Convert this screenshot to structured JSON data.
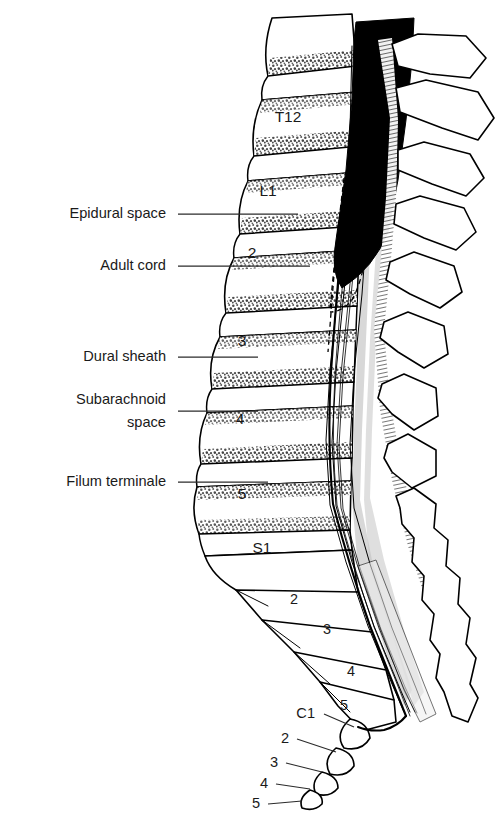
{
  "figure": {
    "background_color": "#ffffff",
    "ink_color": "#000000",
    "shading_color": "#d8d8d8"
  },
  "labels": [
    {
      "id": "epidural-space",
      "text": "Epidural space",
      "text_x": 166,
      "text_y": 218,
      "leader_x1": 178,
      "leader_y1": 214,
      "leader_x2": 298,
      "leader_y2": 214
    },
    {
      "id": "adult-cord",
      "text": "Adult cord",
      "text_x": 166,
      "text_y": 270,
      "leader_x1": 178,
      "leader_y1": 266,
      "leader_x2": 310,
      "leader_y2": 266
    },
    {
      "id": "dural-sheath",
      "text": "Dural sheath",
      "text_x": 166,
      "text_y": 361,
      "leader_x1": 178,
      "leader_y1": 357,
      "leader_x2": 258,
      "leader_y2": 357
    },
    {
      "id": "subarachnoid-space",
      "text": "Subarachnoid",
      "text_x": 166,
      "text_y": 404,
      "text_line2": "space",
      "text_line2_x": 166,
      "text_line2_y": 427,
      "leader_x1": 178,
      "leader_y1": 411,
      "leader_x2": 258,
      "leader_y2": 411
    },
    {
      "id": "filum-terminale",
      "text": "Filum terminale",
      "text_x": 166,
      "text_y": 486,
      "leader_x1": 178,
      "leader_y1": 482,
      "leader_x2": 268,
      "leader_y2": 482
    }
  ],
  "vertebrae": [
    {
      "id": "T12",
      "label": "T12",
      "x": 288,
      "y": 122,
      "region": "thoracic"
    },
    {
      "id": "L1",
      "label": "L1",
      "x": 268,
      "y": 196,
      "region": "lumbar"
    },
    {
      "id": "L2",
      "label": "2",
      "x": 252,
      "y": 258,
      "region": "lumbar"
    },
    {
      "id": "L3",
      "label": "3",
      "x": 242,
      "y": 346,
      "region": "lumbar"
    },
    {
      "id": "L4",
      "label": "4",
      "x": 240,
      "y": 424,
      "region": "lumbar"
    },
    {
      "id": "L5",
      "label": "5",
      "x": 242,
      "y": 499,
      "region": "lumbar"
    },
    {
      "id": "S1",
      "label": "S1",
      "x": 262,
      "y": 553,
      "region": "sacral"
    },
    {
      "id": "S2",
      "label": "2",
      "x": 294,
      "y": 604,
      "region": "sacral"
    },
    {
      "id": "S3",
      "label": "3",
      "x": 327,
      "y": 634,
      "region": "sacral"
    },
    {
      "id": "S4",
      "label": "4",
      "x": 351,
      "y": 676,
      "region": "sacral"
    },
    {
      "id": "S5",
      "label": "5",
      "x": 344,
      "y": 710,
      "region": "sacral"
    }
  ],
  "coccyx": [
    {
      "id": "C1",
      "label": "C1",
      "text_x": 315,
      "text_y": 718,
      "leader_x1": 324,
      "leader_y1": 714,
      "leader_x2": 354,
      "leader_y2": 727
    },
    {
      "id": "C2",
      "label": "2",
      "text_x": 289,
      "text_y": 743,
      "leader_x1": 297,
      "leader_y1": 739,
      "leader_x2": 336,
      "leader_y2": 752
    },
    {
      "id": "C3",
      "label": "3",
      "text_x": 278,
      "text_y": 767,
      "leader_x1": 286,
      "leader_y1": 763,
      "leader_x2": 322,
      "leader_y2": 772
    },
    {
      "id": "C4",
      "label": "4",
      "text_x": 268,
      "text_y": 788,
      "leader_x1": 276,
      "leader_y1": 784,
      "leader_x2": 310,
      "leader_y2": 789
    },
    {
      "id": "C5",
      "label": "5",
      "text_x": 260,
      "text_y": 808,
      "leader_x1": 268,
      "leader_y1": 804,
      "leader_x2": 302,
      "leader_y2": 801
    }
  ]
}
